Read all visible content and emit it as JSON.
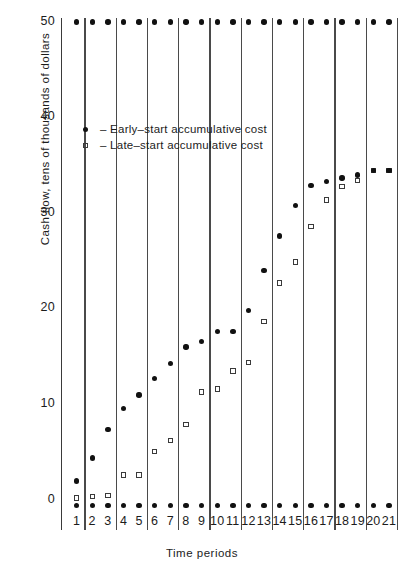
{
  "chart_data": {
    "type": "scatter",
    "title": "",
    "xlabel": "Time periods",
    "ylabel": "Cash flow, tens of thousands of dollars",
    "xticklabels": [
      "1",
      "2",
      "3",
      "4",
      "5",
      "6",
      "7",
      "8",
      "9",
      "10",
      "11",
      "12",
      "13",
      "14",
      "15",
      "16",
      "17",
      "18",
      "19",
      "20",
      "21"
    ],
    "yticklabels": [
      "0",
      "10",
      "20",
      "30",
      "40",
      "50"
    ],
    "yticks": [
      0,
      10,
      20,
      30,
      40,
      50
    ],
    "ylim": [
      -1.5,
      51
    ],
    "xlim": [
      0.5,
      21.5
    ],
    "grid": "vertical separators between period pairs",
    "legend_position": "upper left inside plot",
    "x": [
      1,
      2,
      3,
      4,
      5,
      6,
      7,
      8,
      9,
      10,
      11,
      12,
      13,
      14,
      15,
      16,
      17,
      18,
      19,
      20,
      21
    ],
    "series": [
      {
        "name": "Early-start accumulative cost",
        "marker": "filled-circle",
        "values": [
          2.0,
          4.4,
          7.4,
          9.6,
          11.0,
          12.7,
          14.3,
          16.0,
          16.6,
          17.6,
          17.6,
          19.8,
          24.0,
          27.6,
          30.8,
          32.9,
          33.3,
          33.7,
          34.0,
          34.5,
          34.5
        ]
      },
      {
        "name": "Late-start accumulative cost",
        "marker": "open-square",
        "values": [
          0.2,
          0.4,
          0.5,
          2.6,
          2.6,
          5.1,
          6.2,
          7.9,
          11.3,
          11.6,
          13.5,
          14.4,
          18.7,
          22.7,
          24.9,
          28.6,
          31.4,
          32.8,
          33.4,
          34.5,
          34.5
        ]
      },
      {
        "name": "Upper reference row",
        "marker": "filled-circle",
        "values": [
          50,
          50,
          50,
          50,
          50,
          50,
          50,
          50,
          50,
          50,
          50,
          50,
          50,
          50,
          50,
          50,
          50,
          50,
          50,
          50,
          50
        ]
      },
      {
        "name": "Baseline reference row",
        "marker": "filled-circle",
        "values": [
          -0.6,
          -0.6,
          -0.6,
          -0.6,
          -0.6,
          -0.6,
          -0.6,
          -0.6,
          -0.6,
          -0.6,
          -0.6,
          -0.6,
          -0.6,
          -0.6,
          -0.6,
          -0.6,
          -0.6,
          -0.6,
          -0.6,
          -0.6,
          -0.6
        ]
      }
    ],
    "annotations": []
  },
  "legend": {
    "entries": [
      {
        "marker": "filled-circle",
        "label": "– Early–start accumulative cost"
      },
      {
        "marker": "open-square",
        "label": "– Late–start accumulative cost"
      }
    ]
  }
}
